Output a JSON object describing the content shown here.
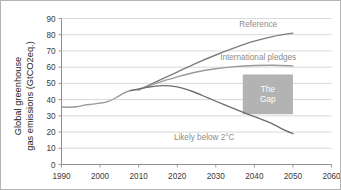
{
  "chart_data": {
    "type": "line",
    "title": "",
    "xlabel": "",
    "ylabel": "Global greenhouse gas emissions (GtCO2eq.)",
    "ylabel_line1": "Global greenhouse",
    "ylabel_line2": "gas emissions (GtCO2eq.)",
    "xlim": [
      1990,
      2060
    ],
    "ylim": [
      0,
      90
    ],
    "xticks": [
      1990,
      2000,
      2010,
      2020,
      2030,
      2040,
      2050,
      2060
    ],
    "yticks": [
      0,
      10,
      20,
      30,
      40,
      50,
      60,
      70,
      80,
      90
    ],
    "grid": "horizontal",
    "legend_position": "inline-annotations",
    "series": [
      {
        "name": "Historical",
        "label": "",
        "color": "#9a9a9a",
        "x": [
          1990,
          1992,
          1994,
          1996,
          1998,
          2000,
          2002,
          2004,
          2006,
          2008,
          2010
        ],
        "values": [
          35.5,
          35.3,
          35.6,
          36.6,
          37.2,
          37.8,
          38.8,
          41.0,
          43.8,
          45.6,
          46.0
        ]
      },
      {
        "name": "Reference",
        "label": "Reference",
        "color": "#7d7d7d",
        "x": [
          2010,
          2015,
          2020,
          2025,
          2030,
          2035,
          2040,
          2045,
          2050
        ],
        "values": [
          46.0,
          51.5,
          57.0,
          62.5,
          67.5,
          72.0,
          76.0,
          79.0,
          81.0
        ]
      },
      {
        "name": "International pledges",
        "label": "International pledges",
        "color": "#9a9a9a",
        "x": [
          2010,
          2015,
          2020,
          2025,
          2030,
          2035,
          2040,
          2045,
          2050
        ],
        "values": [
          46.0,
          50.5,
          54.0,
          57.0,
          59.0,
          60.3,
          61.0,
          61.2,
          60.8
        ]
      },
      {
        "name": "Likely below 2 C",
        "label": "Likely below 2°C",
        "color": "#6e6e6e",
        "x": [
          2008,
          2012,
          2016,
          2020,
          2024,
          2028,
          2032,
          2036,
          2040,
          2044,
          2048,
          2050
        ],
        "values": [
          45.6,
          47.5,
          48.6,
          47.8,
          45.0,
          41.0,
          37.0,
          33.2,
          29.5,
          25.8,
          21.0,
          19.0
        ]
      }
    ],
    "annotations": [
      {
        "name": "reference-label",
        "text": "Reference",
        "x": 2041,
        "y": 84.5,
        "anchor": "middle",
        "color": "#8c8c8c"
      },
      {
        "name": "international-pledges-label",
        "text": "International pledges",
        "x": 2041,
        "y": 64.5,
        "anchor": "middle",
        "color": "#8c8c8c"
      },
      {
        "name": "likely-below-2c-label",
        "text": "Likely below 2°C",
        "x": 2027,
        "y": 15.0,
        "anchor": "middle",
        "color": "#8c8c8c"
      }
    ],
    "shaded_regions": [
      {
        "name": "the-gap-box",
        "label_line1": "The",
        "label_line2": "Gap",
        "x0": 2037,
        "x1": 2050,
        "y0": 31.0,
        "y1": 55.5,
        "color": "#b3b3b3",
        "text_color": "#ffffff"
      }
    ]
  }
}
